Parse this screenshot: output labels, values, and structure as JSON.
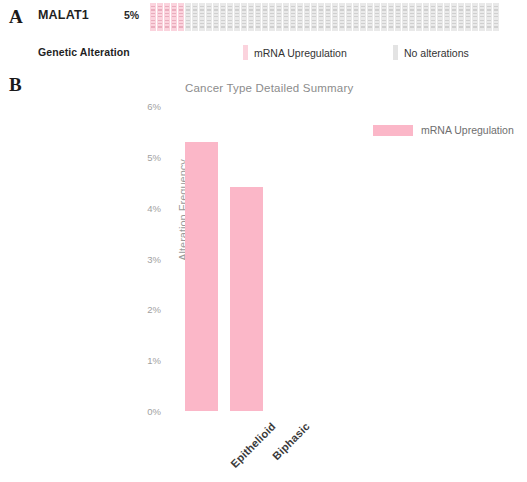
{
  "figure": {
    "panel_a_letter": "A",
    "panel_b_letter": "B"
  },
  "oncoprint": {
    "gene": "MALAT1",
    "percent_altered": "5%",
    "legend_title": "Genetic Alteration",
    "legend": [
      {
        "label": "mRNA Upregulation",
        "color": "#fbd3dd",
        "swatch": "alteration-swatch"
      },
      {
        "label": "No alterations",
        "color": "#e3e3e3",
        "swatch": "no-alteration-swatch"
      }
    ],
    "total_tiles": 50,
    "altered_tiles": 5
  },
  "chart_legend": {
    "label": "mRNA Upregulation",
    "color": "#fbb7c8"
  },
  "chart_data": {
    "type": "bar",
    "title": "Cancer Type Detailed Summary",
    "xlabel": "",
    "ylabel": "Alteration Frequency",
    "categories": [
      "Epithelioid",
      "Biphasic"
    ],
    "values": [
      5.3,
      4.4
    ],
    "series": [
      {
        "name": "mRNA Upregulation",
        "values": [
          5.3,
          4.4
        ],
        "color": "#fbb7c8"
      }
    ],
    "ylim": [
      0,
      6
    ],
    "ytick_labels": [
      "0%",
      "1%",
      "2%",
      "3%",
      "4%",
      "5%",
      "6%"
    ],
    "ytick_values": [
      0,
      1,
      2,
      3,
      4,
      5,
      6
    ],
    "grid": false,
    "legend_position": "top-right"
  }
}
